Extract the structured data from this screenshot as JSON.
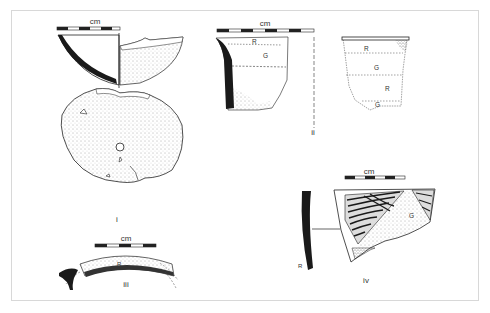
{
  "figure": {
    "scale_unit": "cm",
    "items": [
      {
        "id": "i",
        "label": "i",
        "description": "bowl section and plan view with perforation"
      },
      {
        "id": "ii",
        "label": "ii",
        "description": "vessel rim section with painted bands",
        "bands_section": [
          "R",
          "G"
        ],
        "bands_exterior": [
          "R",
          "G",
          "R",
          "G"
        ]
      },
      {
        "id": "iii",
        "label": "iii",
        "description": "rim fragment plan",
        "band": "R"
      },
      {
        "id": "iv",
        "label": "iv",
        "description": "decorated sherd with hatched pattern",
        "band_section": "R",
        "band_face": "G"
      }
    ]
  }
}
